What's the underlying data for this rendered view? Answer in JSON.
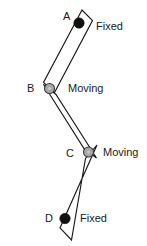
{
  "figure": {
    "background_color": "#ffffff",
    "stroke_color": "#1a1a1a",
    "fixed_joint_color": "#111111",
    "moving_joint_color": "#a9a9a9",
    "width": 147,
    "height": 246
  },
  "points": {
    "a": {
      "label": "A",
      "x": 63,
      "y": 17,
      "kind": "Fixed"
    },
    "b": {
      "label": "B",
      "x": 30,
      "y": 89,
      "kind": "Moving"
    },
    "c": {
      "label": "C",
      "x": 66,
      "y": 154,
      "kind": "Moving"
    },
    "d": {
      "label": "D",
      "x": 45,
      "y": 219,
      "kind": "Fixed"
    }
  },
  "annotations": {
    "fixed_top": "Fixed",
    "moving_upper": "Moving",
    "moving_lower": "Moving",
    "fixed_bottom": "Fixed"
  },
  "links": [
    {
      "name": "link-ab",
      "from": "A",
      "to": "B",
      "polygon": "82,10 92.5,20.5 54.5,92.5 43.5,82.5"
    },
    {
      "name": "link-bc",
      "from": "B",
      "to": "C",
      "polygon": "43.5,84.5 56,94.5 96.5,158 84,148.5"
    },
    {
      "name": "link-cd",
      "from": "C",
      "to": "D",
      "polygon": "97,145 85.5,158.5 71.5,240 60,228"
    }
  ],
  "joints": [
    {
      "name": "joint-a",
      "type": "fixed",
      "cx": 79,
      "cy": 23,
      "r": 5.2
    },
    {
      "name": "joint-b",
      "type": "moving",
      "cx": 49.5,
      "cy": 88.5,
      "r": 5.0
    },
    {
      "name": "joint-c",
      "type": "moving",
      "cx": 88.5,
      "cy": 152,
      "r": 5.0
    },
    {
      "name": "joint-d",
      "type": "fixed",
      "cx": 65,
      "cy": 218.5,
      "r": 5.2
    }
  ]
}
